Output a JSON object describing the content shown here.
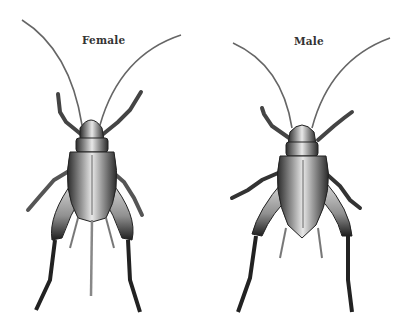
{
  "figure": {
    "specimens": [
      {
        "label": "Female",
        "features": [
          "antennae",
          "forelegs",
          "middle legs",
          "hind legs",
          "cerci",
          "ovipositor"
        ]
      },
      {
        "label": "Male",
        "features": [
          "antennae",
          "forelegs",
          "middle legs",
          "hind legs",
          "cerci"
        ]
      }
    ]
  },
  "colors": {
    "background": "#ffffff",
    "label_text": "#333333",
    "body_dark": "#2a2a2a",
    "body_mid": "#8a8a8a",
    "body_light": "#e6e6e6"
  }
}
